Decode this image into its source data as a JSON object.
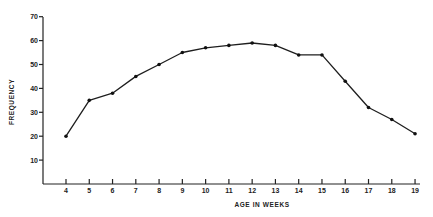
{
  "chart_data": {
    "type": "line",
    "title": "",
    "xlabel": "AGE IN WEEKS",
    "ylabel": "FREQUENCY",
    "x": [
      4,
      5,
      6,
      7,
      8,
      9,
      10,
      11,
      12,
      13,
      14,
      15,
      16,
      17,
      18,
      19
    ],
    "series": [
      {
        "name": "Frequency",
        "values": [
          20,
          35,
          38,
          45,
          50,
          55,
          57,
          58,
          59,
          58,
          54,
          54,
          43,
          32,
          27,
          21
        ]
      }
    ],
    "x_tick_labels": [
      "4",
      "5",
      "6",
      "7",
      "8",
      "9",
      "10",
      "11",
      "12",
      "13",
      "14",
      "15",
      "16",
      "17",
      "18",
      "19"
    ],
    "y_ticks": [
      10,
      20,
      30,
      40,
      50,
      60,
      70
    ],
    "y_tick_labels": [
      "10",
      "20",
      "30",
      "40",
      "50",
      "60",
      "70"
    ],
    "xlim": [
      3,
      19.2
    ],
    "ylim": [
      0,
      70
    ],
    "grid": false,
    "legend": "none",
    "markers": "filled-circle"
  }
}
